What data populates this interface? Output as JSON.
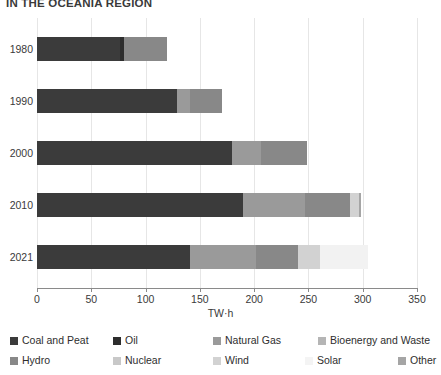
{
  "chart_data": {
    "type": "bar",
    "orientation": "horizontal",
    "stacked": true,
    "title": "IN THE OCEANIA REGION",
    "xlabel": "TW·h",
    "ylabel": "",
    "xlim": [
      0,
      350
    ],
    "xticks": [
      0,
      50,
      100,
      150,
      200,
      250,
      300,
      350
    ],
    "xtick_labels": [
      "0",
      "50",
      "100",
      "150",
      "200",
      "250",
      "300",
      "350"
    ],
    "grid": true,
    "grid_axis": "x",
    "legend_position": "bottom",
    "categories": [
      "1980",
      "1990",
      "2000",
      "2010",
      "2021"
    ],
    "series": [
      {
        "name": "Coal and Peat",
        "color": "#3b3b3b",
        "values": [
          76,
          129,
          180,
          190,
          141
        ]
      },
      {
        "name": "Oil",
        "color": "#2d2d2d",
        "values": [
          4,
          0,
          0,
          0,
          0
        ]
      },
      {
        "name": "Natural Gas",
        "color": "#9a9a9a",
        "values": [
          0,
          12,
          26,
          57,
          61
        ]
      },
      {
        "name": "Bioenergy and Waste",
        "color": "#b5b5b5",
        "values": [
          0,
          0,
          0,
          0,
          0
        ]
      },
      {
        "name": "Hydro",
        "color": "#888888",
        "values": [
          40,
          29,
          43,
          41,
          38
        ]
      },
      {
        "name": "Nuclear",
        "color": "#c8c8c8",
        "values": [
          0,
          0,
          0,
          0,
          0
        ]
      },
      {
        "name": "Wind",
        "color": "#d2d2d2",
        "values": [
          0,
          0,
          0,
          9,
          21
        ]
      },
      {
        "name": "Solar",
        "color": "#f2f2f2",
        "values": [
          0,
          0,
          0,
          0,
          44
        ]
      },
      {
        "name": "Other",
        "color": "#a5a5a5",
        "values": [
          0,
          0,
          0,
          1,
          0
        ]
      }
    ],
    "totals": [
      120,
      170,
      249,
      298,
      305
    ]
  },
  "legend": {
    "row1": [
      {
        "label": "Coal and Peat",
        "color": "#3b3b3b"
      },
      {
        "label": "Oil",
        "color": "#2d2d2d"
      },
      {
        "label": "Natural Gas",
        "color": "#9a9a9a"
      },
      {
        "label": "Bioenergy and Waste",
        "color": "#b5b5b5"
      }
    ],
    "row2": [
      {
        "label": "Hydro",
        "color": "#888888"
      },
      {
        "label": "Nuclear",
        "color": "#c8c8c8"
      },
      {
        "label": "Wind",
        "color": "#d2d2d2"
      },
      {
        "label": "Solar",
        "color": "#f4f4f4"
      },
      {
        "label": "Other",
        "color": "#a5a5a5"
      }
    ]
  },
  "colors": {
    "background": "#ffffff",
    "text": "#3a3a3a",
    "grid": "#e6e6e6",
    "axis": "#8a8a8a"
  }
}
